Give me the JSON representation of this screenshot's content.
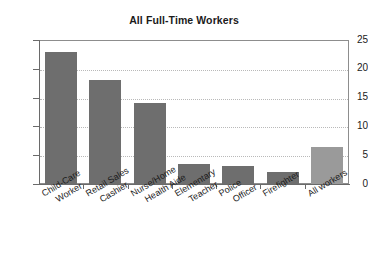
{
  "chart_data": {
    "type": "bar",
    "title": "All Full-Time Workers",
    "xlabel": "",
    "ylabel": "",
    "ylim": [
      0,
      25
    ],
    "yticks": [
      0,
      5,
      10,
      15,
      20,
      25
    ],
    "grid": true,
    "legend": "none",
    "categories": [
      "Child-Care Worker",
      "Retail Sales Cashier",
      "Nurse/Home Health Aide",
      "Elementary Teacher",
      "Police Officer",
      "Firefighter",
      "All workers"
    ],
    "category_lines": [
      [
        "Child-Care",
        "Worker"
      ],
      [
        "Retail Sales",
        "Cashier"
      ],
      [
        "Nurse/Home",
        "Health Aide"
      ],
      [
        "Elementary",
        "Teacher"
      ],
      [
        "Police",
        "Officer"
      ],
      [
        "Firefighter",
        ""
      ],
      [
        "All workers",
        ""
      ]
    ],
    "values": [
      23.0,
      18.0,
      14.0,
      3.4,
      3.1,
      2.0,
      6.4
    ],
    "bar_colors": [
      "#6e6e6e",
      "#6e6e6e",
      "#6e6e6e",
      "#6e6e6e",
      "#6e6e6e",
      "#6e6e6e",
      "#9a9a9a"
    ]
  },
  "colors": {
    "bar_dark": "#6e6e6e",
    "bar_light": "#9a9a9a",
    "axis": "#6a6a6a",
    "grid": "#b9b9b9",
    "frame": "#8d8d8d",
    "text": "#1b1b1b",
    "background": "#ffffff"
  },
  "ytick_labels": [
    "0",
    "5",
    "10",
    "15",
    "20",
    "25"
  ]
}
